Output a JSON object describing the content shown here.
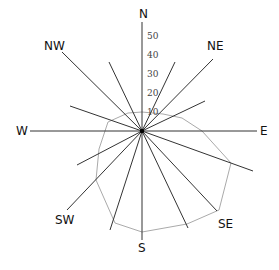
{
  "diagram": {
    "type": "wind-rose",
    "center": [
      142,
      131
    ],
    "scale_px_per_unit": 1.9,
    "directions": [
      {
        "name": "N",
        "label": "N",
        "x": 139,
        "y": 8
      },
      {
        "name": "NE",
        "label": "NE",
        "x": 207,
        "y": 40
      },
      {
        "name": "E",
        "label": "E",
        "x": 260,
        "y": 125
      },
      {
        "name": "SE",
        "label": "SE",
        "x": 218,
        "y": 218
      },
      {
        "name": "S",
        "label": "S",
        "x": 138,
        "y": 242
      },
      {
        "name": "SW",
        "label": "SW",
        "x": 55,
        "y": 214
      },
      {
        "name": "W",
        "label": "W",
        "x": 16,
        "y": 125
      },
      {
        "name": "NW",
        "label": "NW",
        "x": 44,
        "y": 40
      }
    ],
    "axis_ticks": [
      {
        "label": "50",
        "y": 32
      },
      {
        "label": "40",
        "y": 51
      },
      {
        "label": "30",
        "y": 70
      },
      {
        "label": "20",
        "y": 89
      },
      {
        "label": "10",
        "y": 108
      }
    ],
    "rays": [
      {
        "dir": "N",
        "x2": 142,
        "y2": 22
      },
      {
        "dir": "NNE",
        "x2": 175,
        "y2": 62
      },
      {
        "dir": "NE",
        "x2": 213,
        "y2": 59
      },
      {
        "dir": "ENE",
        "x2": 205,
        "y2": 101
      },
      {
        "dir": "E",
        "x2": 257,
        "y2": 131
      },
      {
        "dir": "ESE",
        "x2": 253,
        "y2": 171
      },
      {
        "dir": "SE",
        "x2": 217,
        "y2": 211
      },
      {
        "dir": "SSE",
        "x2": 188,
        "y2": 228
      },
      {
        "dir": "S",
        "x2": 142,
        "y2": 240
      },
      {
        "dir": "SSW",
        "x2": 110,
        "y2": 230
      },
      {
        "dir": "SW",
        "x2": 67,
        "y2": 210
      },
      {
        "dir": "WSW",
        "x2": 77,
        "y2": 165
      },
      {
        "dir": "W",
        "x2": 30,
        "y2": 131
      },
      {
        "dir": "WNW",
        "x2": 70,
        "y2": 106
      },
      {
        "dir": "NW",
        "x2": 62,
        "y2": 52
      },
      {
        "dir": "NNW",
        "x2": 109,
        "y2": 62
      }
    ],
    "polygon_points": "142,112 163,114 182,118 202,131 231,163 219,210 187,224 142,232 115,223 96,180 99,149 108,122 128,113",
    "colors": {
      "ray": "#333333",
      "polygon": "#aaaaaa",
      "text": "#111111"
    }
  }
}
